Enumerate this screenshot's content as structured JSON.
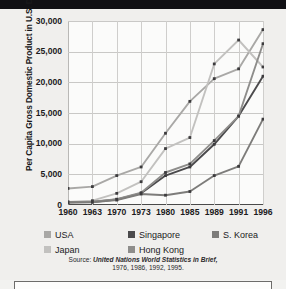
{
  "figure": {
    "background_color": "#f0efed",
    "top_bar_color": "#111014"
  },
  "axis": {
    "y_title": "Per Capita Gross Domestic Product in U.S. Dollars",
    "y_ticks": [
      "30,000",
      "25,000",
      "20,000",
      "15,000",
      "10,000",
      "5,000",
      "0"
    ],
    "x_ticks": [
      "1960",
      "1963",
      "1970",
      "1973",
      "1980",
      "1985",
      "1989",
      "1991",
      "1996"
    ]
  },
  "legend": {
    "items": [
      {
        "label": "USA",
        "color": "#a9a8a6"
      },
      {
        "label": "Singapore",
        "color": "#4b4a4c"
      },
      {
        "label": "S. Korea",
        "color": "#7d7c7a"
      },
      {
        "label": "Japan",
        "color": "#c2c1bf"
      },
      {
        "label": "Hong Kong",
        "color": "#8e8d8b"
      }
    ]
  },
  "source": {
    "lead": "Source: ",
    "title": "United Nations World Statistics in Brief,",
    "line2": "1976, 1986, 1992, 1995."
  },
  "chart_data": {
    "type": "line",
    "title": "",
    "xlabel": "",
    "ylabel": "Per Capita Gross Domestic Product in U.S. Dollars",
    "x": [
      1960,
      1963,
      1970,
      1973,
      1980,
      1985,
      1989,
      1991,
      1996
    ],
    "x_tick_labels": [
      "1960",
      "1963",
      "1970",
      "1973",
      "1980",
      "1985",
      "1989",
      "1991",
      "1996"
    ],
    "x_positions_even_spacing": true,
    "ylim": [
      0,
      30000
    ],
    "y_ticks": [
      0,
      5000,
      10000,
      15000,
      20000,
      25000,
      30000
    ],
    "grid": true,
    "legend_position": "below",
    "series": [
      {
        "name": "USA",
        "color": "#a9a8a6",
        "values": [
          2700,
          3000,
          4800,
          6200,
          11700,
          16900,
          20600,
          22200,
          28600
        ]
      },
      {
        "name": "Japan",
        "color": "#c2c1bf",
        "values": [
          500,
          700,
          1900,
          3800,
          9200,
          11000,
          23000,
          26900,
          22500
        ]
      },
      {
        "name": "Singapore",
        "color": "#4b4a4c",
        "values": [
          450,
          500,
          900,
          1900,
          4800,
          6200,
          9900,
          14500,
          21000
        ]
      },
      {
        "name": "Hong Kong",
        "color": "#8e8d8b",
        "values": [
          450,
          550,
          950,
          2000,
          5300,
          6700,
          10500,
          14500,
          26300
        ]
      },
      {
        "name": "S. Korea",
        "color": "#7d7c7a",
        "values": [
          400,
          450,
          800,
          1800,
          1600,
          2200,
          4800,
          6300,
          14000
        ]
      }
    ]
  }
}
